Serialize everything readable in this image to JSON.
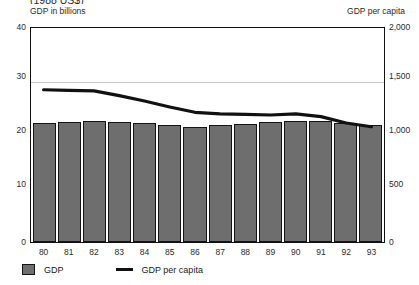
{
  "chart_data": {
    "type": "bar",
    "title": "(1988 US$)",
    "title_note": "clipped at top edge of screenshot",
    "xlabel": "",
    "ylabel": "GDP in billions",
    "y2label": "GDP per capita",
    "categories": [
      "80",
      "81",
      "82",
      "83",
      "84",
      "85",
      "86",
      "87",
      "88",
      "89",
      "90",
      "91",
      "92",
      "93"
    ],
    "ylim": [
      0,
      40
    ],
    "y2lim": [
      0,
      2000
    ],
    "yticks": [
      "0",
      "10",
      "20",
      "30",
      "40"
    ],
    "ytick_values": [
      0,
      10,
      20,
      30,
      40
    ],
    "y2ticks": [
      "0",
      "500",
      "1,000",
      "1,500",
      "2,000"
    ],
    "y2tick_values": [
      0,
      500,
      1000,
      1500,
      2000
    ],
    "grid": "horizontal gridline at 30 only",
    "legend_position": "below plot, left aligned",
    "series": [
      {
        "name": "GDP",
        "type": "bar",
        "axis": "left",
        "color": "#6e6e6e",
        "edge_color": "#141414",
        "values": [
          22.0,
          22.3,
          22.5,
          22.2,
          22.0,
          21.6,
          21.3,
          21.6,
          21.8,
          22.2,
          22.4,
          22.4,
          22.0,
          21.6
        ]
      },
      {
        "name": "GDP per capita",
        "type": "line",
        "axis": "right",
        "color": "#111111",
        "values": [
          1425,
          1420,
          1415,
          1370,
          1320,
          1265,
          1215,
          1200,
          1195,
          1190,
          1200,
          1175,
          1115,
          1080
        ]
      }
    ]
  },
  "header": {
    "title_clipped": "(1988 US$)",
    "left_axis_caption": "GDP in billions",
    "right_axis_caption": "GDP per capita"
  },
  "axes": {
    "left_ticks": [
      "40",
      "30",
      "20",
      "10",
      "0"
    ],
    "right_ticks": [
      "2,000",
      "1,500",
      "1,000",
      "500",
      "0"
    ],
    "x_ticks": [
      "80",
      "81",
      "82",
      "83",
      "84",
      "85",
      "86",
      "87",
      "88",
      "89",
      "90",
      "91",
      "92",
      "93"
    ]
  },
  "legend": {
    "items": [
      {
        "label": "GDP",
        "swatch": "gray-square"
      },
      {
        "label": "GDP per capita",
        "swatch": "black-line"
      }
    ]
  }
}
